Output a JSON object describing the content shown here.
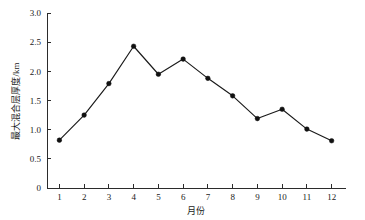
{
  "chart_data": {
    "type": "line",
    "title": "",
    "xlabel": "月份",
    "ylabel": "最大混合层厚度/km",
    "categories": [
      1,
      2,
      3,
      4,
      5,
      6,
      7,
      8,
      9,
      10,
      11,
      12
    ],
    "x_tick_labels": [
      "1",
      "2",
      "3",
      "4",
      "5",
      "6",
      "7",
      "8",
      "9",
      "10",
      "11",
      "12"
    ],
    "y_tick_labels": [
      "0",
      "0.5",
      "1.0",
      "1.5",
      "2.0",
      "2.5",
      "3.0"
    ],
    "y_tick_values": [
      0,
      0.5,
      1.0,
      1.5,
      2.0,
      2.5,
      3.0
    ],
    "values": [
      0.82,
      1.25,
      1.79,
      2.43,
      1.95,
      2.21,
      1.88,
      1.58,
      1.19,
      1.35,
      1.01,
      0.81
    ],
    "series": [
      {
        "name": "最大混合层厚度",
        "values": [
          0.82,
          1.25,
          1.79,
          2.43,
          1.95,
          2.21,
          1.88,
          1.58,
          1.19,
          1.35,
          1.01,
          0.81
        ]
      }
    ],
    "xlim": [
      0.5,
      12.5
    ],
    "ylim": [
      0,
      3.0
    ],
    "grid": false,
    "legend": "none",
    "marker": "filled-circle",
    "line_color": "#1a1a1a",
    "marker_color": "#111111",
    "background_color": "#ffffff",
    "axis_color": "#2b2b2b",
    "spines": [
      "left",
      "bottom"
    ]
  }
}
